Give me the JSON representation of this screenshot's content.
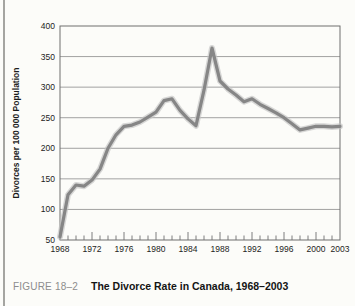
{
  "page": {
    "background": "#fcfcf9",
    "left_rule_color": "#a5a5a1"
  },
  "caption": {
    "label": "FIGURE 18–2",
    "title": "The Divorce Rate in Canada, 1968–2003"
  },
  "chart_data": {
    "type": "line",
    "title": "The Divorce Rate in Canada, 1968–2003",
    "ylabel": "Divorces per 100 000 Population",
    "xlabel": "",
    "ylim": [
      50,
      400
    ],
    "xlim": [
      1968,
      2003
    ],
    "yticks": [
      50,
      100,
      150,
      200,
      250,
      300,
      350,
      400
    ],
    "xtick_labels": [
      1968,
      1972,
      1976,
      1980,
      1984,
      1988,
      1992,
      1996,
      2000,
      2003
    ],
    "minor_xticks": "every year, longer tick every 4 years",
    "grid": "horizontal",
    "legend": "none",
    "line_color": "#868686",
    "line_halo_color": "#c3c3c3",
    "series": [
      {
        "name": "Divorces per 100 000 population",
        "x": [
          1968,
          1969,
          1970,
          1971,
          1972,
          1973,
          1974,
          1975,
          1976,
          1977,
          1978,
          1979,
          1980,
          1981,
          1982,
          1983,
          1984,
          1985,
          1986,
          1987,
          1988,
          1989,
          1990,
          1991,
          1992,
          1993,
          1994,
          1995,
          1996,
          1997,
          1998,
          1999,
          2000,
          2001,
          2002,
          2003
        ],
        "values": [
          55,
          124,
          140,
          138,
          148,
          166,
          200,
          222,
          236,
          238,
          243,
          251,
          259,
          278,
          281,
          262,
          248,
          237,
          295,
          364,
          310,
          297,
          287,
          276,
          281,
          272,
          265,
          258,
          250,
          240,
          230,
          233,
          236,
          236,
          235,
          236
        ]
      }
    ]
  }
}
